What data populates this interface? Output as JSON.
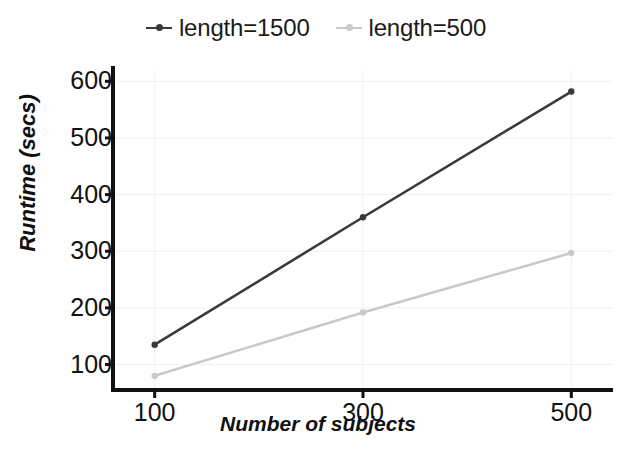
{
  "chart_data": {
    "type": "line",
    "title": "",
    "xlabel": "Number of subjects",
    "ylabel": "Runtime (secs)",
    "x": [
      100,
      300,
      500
    ],
    "xtick_labels": [
      "100",
      "300",
      "500"
    ],
    "ytick_labels": [
      "100",
      "200",
      "300",
      "400",
      "500",
      "600"
    ],
    "yticks": [
      100,
      200,
      300,
      400,
      500,
      600
    ],
    "xlim": [
      60,
      540
    ],
    "ylim": [
      55,
      620
    ],
    "grid": true,
    "legend_position": "top-center",
    "series": [
      {
        "name": "length=1500",
        "color": "#3a3a3a",
        "marker": "circle",
        "values": [
          135,
          360,
          582
        ]
      },
      {
        "name": "length=500",
        "color": "#c9c9c9",
        "marker": "circle",
        "values": [
          80,
          192,
          297
        ]
      }
    ]
  },
  "legend": {
    "entries": [
      {
        "label": "length=1500",
        "color": "#3a3a3a"
      },
      {
        "label": "length=500",
        "color": "#c9c9c9"
      }
    ]
  },
  "axes": {
    "x_title": "Number of subjects",
    "y_title": "Runtime (secs)",
    "y_ticks": [
      "600",
      "500",
      "400",
      "300",
      "200",
      "100"
    ],
    "x_ticks": [
      "100",
      "300",
      "500"
    ]
  },
  "colors": {
    "series_dark": "#3a3a3a",
    "series_light": "#c9c9c9",
    "axis": "#111111",
    "grid": "#f0f0f0",
    "background": "#ffffff"
  }
}
